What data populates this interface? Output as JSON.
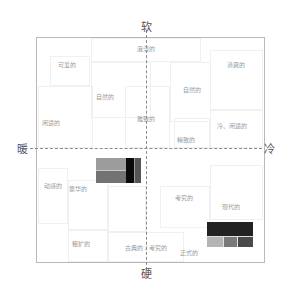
{
  "axes": {
    "top": "软",
    "bottom": "硬",
    "left": "暖",
    "right": "冷"
  },
  "words": [
    {
      "text": "浪漫的",
      "x": 146,
      "y": 48
    },
    {
      "text": "可爱的",
      "x": 67,
      "y": 64
    },
    {
      "text": "清爽的",
      "x": 236,
      "y": 64
    },
    {
      "text": "自然的",
      "x": 105,
      "y": 96
    },
    {
      "text": "自然的",
      "x": 192,
      "y": 89
    },
    {
      "text": "闲适的",
      "x": 51,
      "y": 122
    },
    {
      "text": "雅致的",
      "x": 146,
      "y": 118
    },
    {
      "text": "冷、闲适的",
      "x": 232,
      "y": 125
    },
    {
      "text": "精致的",
      "x": 186,
      "y": 139
    },
    {
      "text": "动感的",
      "x": 53,
      "y": 185
    },
    {
      "text": "豪华的",
      "x": 78,
      "y": 188
    },
    {
      "text": "考究的",
      "x": 184,
      "y": 197
    },
    {
      "text": "现代的",
      "x": 231,
      "y": 206
    },
    {
      "text": "粗犷的",
      "x": 81,
      "y": 243
    },
    {
      "text": "古典的 / 考究的",
      "x": 146,
      "y": 247
    },
    {
      "text": "正式的",
      "x": 189,
      "y": 252
    }
  ],
  "swatches": [
    {
      "name": "warm-hard-swatch",
      "x": 96,
      "y": 158,
      "w": 45,
      "h": 25,
      "layout": "left-grid-right-bars",
      "colors": {
        "top_left": "#9c9c9c",
        "bottom_left": "#737373",
        "divider": "#c8c8c8",
        "bar1": "#0a0a0a",
        "bar2": "#555555"
      }
    },
    {
      "name": "cool-hard-swatch",
      "x": 207,
      "y": 222,
      "w": 46,
      "h": 25,
      "colors": {
        "top": "#222222",
        "bottom": [
          "#b4b4b4",
          "#7a7a7a",
          "#4a4a4a"
        ]
      }
    }
  ]
}
